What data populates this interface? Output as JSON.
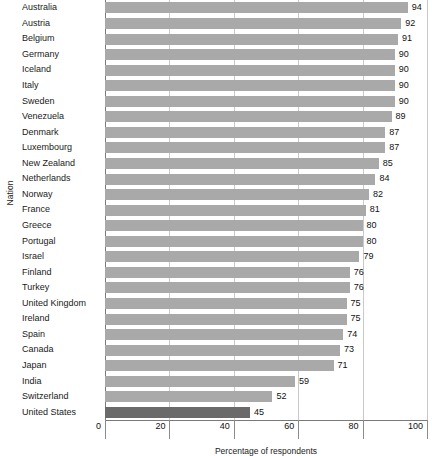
{
  "chart_data": {
    "type": "bar",
    "orientation": "horizontal",
    "title": "",
    "xlabel": "Percentage of respondents",
    "ylabel": "Nation",
    "xlim": [
      0,
      100
    ],
    "xticks": [
      0,
      20,
      40,
      60,
      80,
      100
    ],
    "xtick_labels": [
      "0",
      "20",
      "40",
      "60",
      "80",
      "100"
    ],
    "grid": true,
    "legend": "none",
    "colors": {
      "bar": "#a9a9a9",
      "bar_highlight": "#6a6a6a",
      "gridline": "#c9c9c9",
      "axis": "#7a7a7a",
      "text": "#1a1a1a"
    },
    "categories": [
      "Australia",
      "Austria",
      "Belgium",
      "Germany",
      "Iceland",
      "Italy",
      "Sweden",
      "Venezuela",
      "Denmark",
      "Luxembourg",
      "New Zealand",
      "Netherlands",
      "Norway",
      "France",
      "Greece",
      "Portugal",
      "Israel",
      "Finland",
      "Turkey",
      "United Kingdom",
      "Ireland",
      "Spain",
      "Canada",
      "Japan",
      "India",
      "Switzerland",
      "United States"
    ],
    "values": [
      94,
      92,
      91,
      90,
      90,
      90,
      90,
      89,
      87,
      87,
      85,
      84,
      82,
      81,
      80,
      80,
      79,
      76,
      76,
      75,
      75,
      74,
      73,
      71,
      59,
      52,
      45
    ],
    "value_labels": [
      "94",
      "92",
      "91",
      "90",
      "90",
      "90",
      "90",
      "89",
      "87",
      "87",
      "85",
      "84",
      "82",
      "81",
      "80",
      "80",
      "79",
      "76",
      "76",
      "75",
      "75",
      "74",
      "73",
      "71",
      "59",
      "52",
      "45"
    ],
    "highlighted_category": "United States"
  }
}
